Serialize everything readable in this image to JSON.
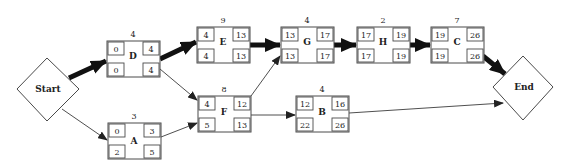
{
  "diagram": {
    "type": "activity-on-node network (critical path)",
    "terminals": {
      "start": {
        "label": "Start"
      },
      "end": {
        "label": "End"
      }
    },
    "activities": [
      {
        "id": "D",
        "duration": "4",
        "es": "0",
        "ef": "4",
        "ls": "0",
        "lf": "4"
      },
      {
        "id": "A",
        "duration": "3",
        "es": "0",
        "ef": "3",
        "ls": "2",
        "lf": "5"
      },
      {
        "id": "E",
        "duration": "9",
        "es": "4",
        "ef": "13",
        "ls": "4",
        "lf": "13"
      },
      {
        "id": "F",
        "duration": "8",
        "es": "4",
        "ef": "12",
        "ls": "5",
        "lf": "13"
      },
      {
        "id": "G",
        "duration": "4",
        "es": "13",
        "ef": "17",
        "ls": "13",
        "lf": "17"
      },
      {
        "id": "B",
        "duration": "4",
        "es": "12",
        "ef": "16",
        "ls": "22",
        "lf": "26"
      },
      {
        "id": "H",
        "duration": "2",
        "es": "17",
        "ef": "19",
        "ls": "17",
        "lf": "19"
      },
      {
        "id": "C",
        "duration": "7",
        "es": "19",
        "ef": "26",
        "ls": "19",
        "lf": "26"
      }
    ],
    "edges": [
      {
        "from": "Start",
        "to": "D",
        "critical": true
      },
      {
        "from": "Start",
        "to": "A",
        "critical": false
      },
      {
        "from": "D",
        "to": "E",
        "critical": true
      },
      {
        "from": "D",
        "to": "F",
        "critical": false
      },
      {
        "from": "A",
        "to": "F",
        "critical": false
      },
      {
        "from": "E",
        "to": "G",
        "critical": true
      },
      {
        "from": "F",
        "to": "G",
        "critical": false
      },
      {
        "from": "F",
        "to": "B",
        "critical": false
      },
      {
        "from": "G",
        "to": "H",
        "critical": true
      },
      {
        "from": "H",
        "to": "C",
        "critical": true
      },
      {
        "from": "C",
        "to": "End",
        "critical": true
      },
      {
        "from": "B",
        "to": "End",
        "critical": false
      }
    ],
    "colors": {
      "line": "#222222",
      "box_stroke": "#4a4a4a",
      "background": "#ffffff"
    }
  }
}
